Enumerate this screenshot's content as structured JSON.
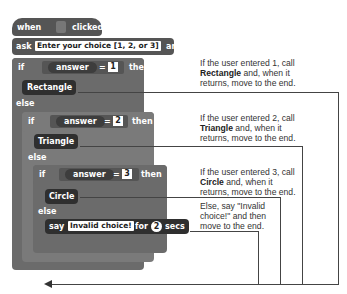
{
  "script": {
    "hat": {
      "when": "when",
      "clicked": "clicked",
      "icon": "green-flag-icon"
    },
    "ask": {
      "label": "ask",
      "prompt": "Enter your choice [1, 2, or 3]",
      "suffix": "and wait"
    },
    "if1": {
      "if": "if",
      "reporter": "answer",
      "op": "=",
      "value": "1",
      "then": "then",
      "call": "Rectangle",
      "else": "else"
    },
    "if2": {
      "if": "if",
      "reporter": "answer",
      "op": "=",
      "value": "2",
      "then": "then",
      "call": "Triangle",
      "else": "else"
    },
    "if3": {
      "if": "if",
      "reporter": "answer",
      "op": "=",
      "value": "3",
      "then": "then",
      "call": "Circle",
      "else": "else"
    },
    "say": {
      "label": "say",
      "message": "Invalid choice!",
      "for": "for",
      "secs_value": "2",
      "secs": "secs"
    }
  },
  "annotations": [
    {
      "pre": "If the user entered 1, call ",
      "bold": "Rectangle",
      "post": " and, when it returns, move to the end."
    },
    {
      "pre": "If the user entered 2, call ",
      "bold": "Triangle",
      "post": " and, when it returns, move to the end."
    },
    {
      "pre": "If the user entered 3, call ",
      "bold": "Circle",
      "post": " and, when it returns, move to the end."
    },
    {
      "pre": "Else, say \"Invalid choice!\" and then move to the end.",
      "bold": "",
      "post": ""
    }
  ]
}
